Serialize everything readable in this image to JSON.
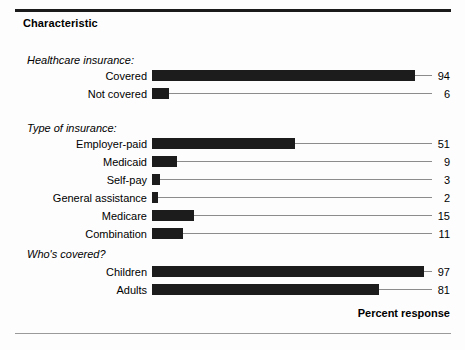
{
  "page": {
    "title": "Characteristic",
    "axis_title": "Percent response",
    "bar_color": "#1c1c1c",
    "line_color": "#8c8c8c",
    "background": "#fdfdfd"
  },
  "chart_data": {
    "type": "bar",
    "orientation": "horizontal",
    "title": "Characteristic",
    "xlabel": "Percent response",
    "ylabel": "",
    "xlim": [
      0,
      100
    ],
    "grid": false,
    "legend": null,
    "groups": [
      {
        "name": "Healthcare insurance:",
        "categories": [
          "Covered",
          "Not covered"
        ],
        "values": [
          94,
          6
        ]
      },
      {
        "name": "Type of insurance:",
        "categories": [
          "Employer-paid",
          "Medicaid",
          "Self-pay",
          "General assistance",
          "Medicare",
          "Combination"
        ],
        "values": [
          51,
          9,
          3,
          2,
          15,
          11
        ]
      },
      {
        "name": "Who's covered?",
        "categories": [
          "Children",
          "Adults"
        ],
        "values": [
          97,
          81
        ]
      }
    ],
    "categories": [
      "Covered",
      "Not covered",
      "Employer-paid",
      "Medicaid",
      "Self-pay",
      "General assistance",
      "Medicare",
      "Combination",
      "Children",
      "Adults"
    ],
    "values": [
      94,
      6,
      51,
      9,
      3,
      2,
      15,
      11,
      97,
      81
    ]
  },
  "layout": {
    "group_header_tops": [
      54,
      122,
      248
    ],
    "row_tops": [
      [
        68,
        86
      ],
      [
        136,
        154,
        172,
        190,
        208,
        226
      ],
      [
        264,
        282
      ]
    ]
  }
}
